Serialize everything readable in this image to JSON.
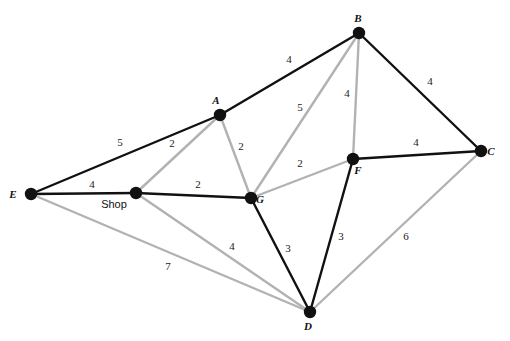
{
  "figure": {
    "width": 510,
    "height": 341,
    "background_color": "#ffffff"
  },
  "style": {
    "edge_black": "#111111",
    "edge_gray": "#b2b2b2",
    "node_fill": "#111111",
    "label_color": "#111111",
    "edge_black_width": 2.4,
    "edge_gray_width": 2.4,
    "node_radius": 6.2
  },
  "nodes": [
    {
      "id": "A",
      "label": "A",
      "x": 220,
      "y": 115,
      "label_dx": -4,
      "label_dy": -11,
      "label_style": "italic"
    },
    {
      "id": "B",
      "label": "B",
      "x": 359,
      "y": 33,
      "label_dx": -1,
      "label_dy": -11,
      "label_style": "italic"
    },
    {
      "id": "C",
      "label": "C",
      "x": 481,
      "y": 151,
      "label_dx": 10,
      "label_dy": 4,
      "label_style": "italic"
    },
    {
      "id": "D",
      "label": "D",
      "x": 310,
      "y": 312,
      "label_dx": -2,
      "label_dy": 18,
      "label_style": "italic"
    },
    {
      "id": "E",
      "label": "E",
      "x": 31,
      "y": 194,
      "label_dx": -18,
      "label_dy": 4,
      "label_style": "italic"
    },
    {
      "id": "F",
      "label": "F",
      "x": 353,
      "y": 159,
      "label_dx": 5,
      "label_dy": 15,
      "label_style": "italic"
    },
    {
      "id": "G",
      "label": "G",
      "x": 251,
      "y": 198,
      "label_dx": 9,
      "label_dy": 5,
      "label_style": "italic"
    },
    {
      "id": "Shop",
      "label": "Shop",
      "x": 136,
      "y": 193,
      "label_dx": -22,
      "label_dy": 15,
      "label_style": "plain"
    }
  ],
  "edges": [
    {
      "id": "E-A",
      "from": "E",
      "to": "A",
      "weight": "5",
      "color": "black",
      "label_x": 120,
      "label_y": 146
    },
    {
      "id": "A-B",
      "from": "A",
      "to": "B",
      "weight": "4",
      "color": "black",
      "label_x": 289,
      "label_y": 63
    },
    {
      "id": "B-C",
      "from": "B",
      "to": "C",
      "weight": "4",
      "color": "black",
      "label_x": 430,
      "label_y": 85
    },
    {
      "id": "F-C",
      "from": "F",
      "to": "C",
      "weight": "4",
      "color": "black",
      "label_x": 416,
      "label_y": 146
    },
    {
      "id": "E-Shop",
      "from": "E",
      "to": "Shop",
      "weight": "4",
      "color": "black",
      "label_x": 92,
      "label_y": 188
    },
    {
      "id": "Shop-G",
      "from": "Shop",
      "to": "G",
      "weight": "2",
      "color": "black",
      "label_x": 198,
      "label_y": 188
    },
    {
      "id": "G-D",
      "from": "G",
      "to": "D",
      "weight": "3",
      "color": "black",
      "label_x": 288,
      "label_y": 252
    },
    {
      "id": "F-D",
      "from": "F",
      "to": "D",
      "weight": "3",
      "color": "black",
      "label_x": 341,
      "label_y": 240
    },
    {
      "id": "Shop-A",
      "from": "Shop",
      "to": "A",
      "weight": "2",
      "color": "gray",
      "label_x": 172,
      "label_y": 147
    },
    {
      "id": "A-G",
      "from": "A",
      "to": "G",
      "weight": "2",
      "color": "gray",
      "label_x": 241,
      "label_y": 150
    },
    {
      "id": "G-B",
      "from": "G",
      "to": "B",
      "weight": "5",
      "color": "gray",
      "label_x": 300,
      "label_y": 111
    },
    {
      "id": "B-F",
      "from": "B",
      "to": "F",
      "weight": "4",
      "color": "gray",
      "label_x": 347,
      "label_y": 97
    },
    {
      "id": "G-F",
      "from": "G",
      "to": "F",
      "weight": "2",
      "color": "gray",
      "label_x": 300,
      "label_y": 167
    },
    {
      "id": "E-D",
      "from": "E",
      "to": "D",
      "weight": "7",
      "color": "gray",
      "label_x": 168,
      "label_y": 270
    },
    {
      "id": "Shop-D",
      "from": "Shop",
      "to": "D",
      "weight": "4",
      "color": "gray",
      "label_x": 232,
      "label_y": 250
    },
    {
      "id": "C-D",
      "from": "C",
      "to": "D",
      "weight": "6",
      "color": "gray",
      "label_x": 406,
      "label_y": 240
    }
  ]
}
